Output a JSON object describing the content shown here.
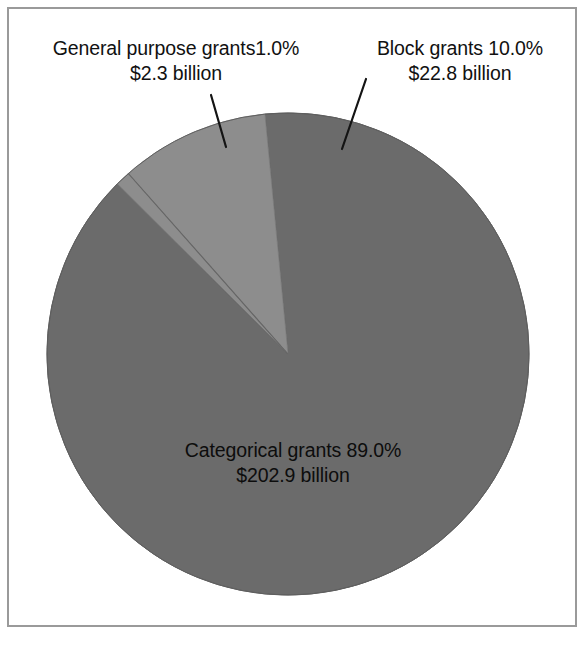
{
  "chart_data": {
    "type": "pie",
    "title": "",
    "subtitle": "",
    "xlabel": "",
    "ylabel": "",
    "legend_position": "none",
    "grid": false,
    "units": "billions of dollars",
    "categories": [
      "General purpose grants",
      "Block grants",
      "Categorical grants"
    ],
    "values": [
      2.3,
      22.8,
      202.9
    ],
    "percentages": [
      1.0,
      10.0,
      89.0
    ],
    "slices": [
      {
        "name": "General purpose grants",
        "percent": 1.0,
        "percent_text": "1.0%",
        "amount": 2.3,
        "amount_text": "$2.3 billion",
        "color": "#8d8d8d",
        "label_line1": "General purpose grants1.0%",
        "label_line2": "$2.3 billion",
        "label_placement": "outside-left"
      },
      {
        "name": "Block grants",
        "percent": 10.0,
        "percent_text": "10.0%",
        "amount": 22.8,
        "amount_text": "$22.8 billion",
        "color": "#8d8d8d",
        "label_line1": "Block grants 10.0%",
        "label_line2": "$22.8 billion",
        "label_placement": "outside-right"
      },
      {
        "name": "Categorical grants",
        "percent": 89.0,
        "percent_text": "89.0%",
        "amount": 202.9,
        "amount_text": "$202.9 billion",
        "color": "#6b6b6b",
        "label_line1": "Categorical grants 89.0%",
        "label_line2": "$202.9 billion",
        "label_placement": "inside"
      }
    ]
  },
  "colors": {
    "slice_light": "#8d8d8d",
    "slice_dark": "#6b6b6b",
    "slice_outline": "#5a5a5a",
    "leader_line": "#1a1a1a",
    "frame_border": "#9a9a9a",
    "background": "#ffffff",
    "text": "#111111"
  },
  "labels": {
    "general": {
      "line1": "General purpose grants1.0%",
      "line2": "$2.3 billion"
    },
    "block": {
      "line1": "Block grants 10.0%",
      "line2": "$22.8 billion"
    },
    "categorical": {
      "line1": "Categorical grants 89.0%",
      "line2": "$202.9 billion"
    }
  }
}
